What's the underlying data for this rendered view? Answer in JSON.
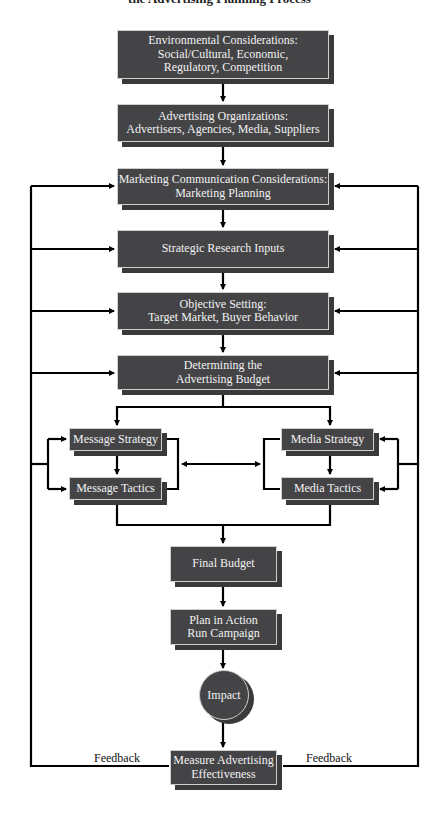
{
  "title": "the Advertising Planning Process",
  "nodes": {
    "environmental": "Environmental Considerations:\nSocial/Cultural, Economic,\nRegulatory, Competition",
    "organizations": "Advertising Organizations:\nAdvertisers, Agencies, Media, Suppliers",
    "marketing_comm": "Marketing Communication Considerations:\nMarketing Planning",
    "strategic_research": "Strategic Research Inputs",
    "objective_setting": "Objective Setting:\nTarget Market, Buyer Behavior",
    "budget": "Determining the\nAdvertising Budget",
    "message_strategy": "Message Strategy",
    "message_tactics": "Message Tactics",
    "media_strategy": "Media Strategy",
    "media_tactics": "Media Tactics",
    "final_budget": "Final Budget",
    "plan_in_action": "Plan in Action\nRun Campaign",
    "impact": "Impact",
    "measure": "Measure Advertising\nEffectiveness"
  },
  "labels": {
    "feedback_left": "Feedback",
    "feedback_right": "Feedback"
  },
  "colors": {
    "box_fill": "#444447",
    "box_border": "#cfcfcf",
    "line": "#000000"
  }
}
